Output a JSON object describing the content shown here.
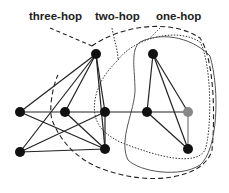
{
  "labels": {
    "three_hop": "three-hop",
    "two_hop": "two-hop",
    "one_hop": "one-hop"
  },
  "colors": {
    "node": "#111111",
    "source_node": "#888888",
    "edge": "#222222",
    "one_hop_boundary": "#555555",
    "two_hop_boundary": "#333333",
    "three_hop_boundary": "#222222"
  },
  "nodes": [
    {
      "id": "n1",
      "x": 96,
      "y": 54
    },
    {
      "id": "n2",
      "x": 153,
      "y": 54
    },
    {
      "id": "n3",
      "x": 20,
      "y": 112
    },
    {
      "id": "n4",
      "x": 65,
      "y": 112
    },
    {
      "id": "n5",
      "x": 105,
      "y": 112
    },
    {
      "id": "n6",
      "x": 147,
      "y": 112
    },
    {
      "id": "n7",
      "x": 188,
      "y": 112,
      "source": true
    },
    {
      "id": "n8",
      "x": 20,
      "y": 152
    },
    {
      "id": "n9",
      "x": 105,
      "y": 149
    },
    {
      "id": "n10",
      "x": 188,
      "y": 149
    }
  ]
}
